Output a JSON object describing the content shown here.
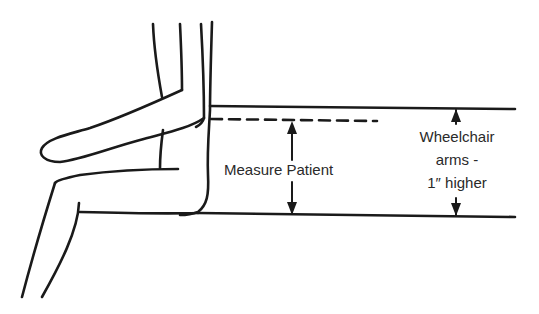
{
  "diagram": {
    "type": "illustration",
    "labels": {
      "measure_patient": "Measure Patient",
      "wheelchair_line1": "Wheelchair",
      "wheelchair_line2": "arms -",
      "wheelchair_line3": "1″ higher"
    },
    "colors": {
      "ink": "#1a1a1a",
      "background": "#ffffff",
      "text": "#2a2a2a"
    }
  }
}
